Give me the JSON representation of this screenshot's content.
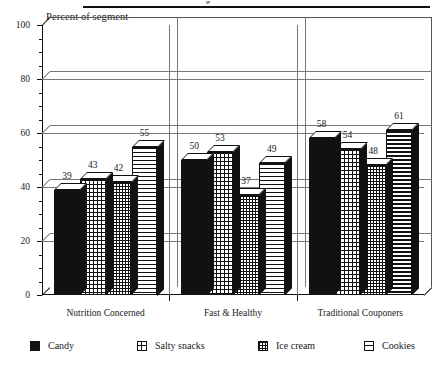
{
  "header": {
    "rule_fragment": "g"
  },
  "chart_data": {
    "type": "bar",
    "title": "",
    "ylabel": "Percent of segment",
    "xlabel": "",
    "ylim": [
      0,
      100
    ],
    "yticks": [
      0,
      20,
      40,
      60,
      80,
      100
    ],
    "ytick_labels": [
      "0",
      "20",
      "40",
      "60",
      "80",
      "100"
    ],
    "grid": true,
    "grid_axis": "y",
    "legend_position": "bottom",
    "categories": [
      "Nutrition Concerned",
      "Fast & Healthy",
      "Traditional Couponers"
    ],
    "series": [
      {
        "name": "Candy",
        "pattern": "solid",
        "values": [
          39,
          50,
          58
        ]
      },
      {
        "name": "Salty snacks",
        "pattern": "grid",
        "values": [
          43,
          53,
          54
        ]
      },
      {
        "name": "Ice cream",
        "pattern": "dots",
        "values": [
          42,
          37,
          48
        ]
      },
      {
        "name": "Cookies",
        "pattern": "hlines",
        "values": [
          55,
          49,
          61
        ]
      }
    ]
  },
  "legend": {
    "items": [
      {
        "label": "Candy",
        "swatch": "sw-solid"
      },
      {
        "label": "Salty snacks",
        "swatch": "sw-grid"
      },
      {
        "label": "Ice cream",
        "swatch": "sw-dots"
      },
      {
        "label": "Cookies",
        "swatch": "sw-hlines"
      }
    ]
  },
  "colors": {
    "ink": "#111111",
    "grid": "#777777",
    "paper": "#ffffff"
  }
}
